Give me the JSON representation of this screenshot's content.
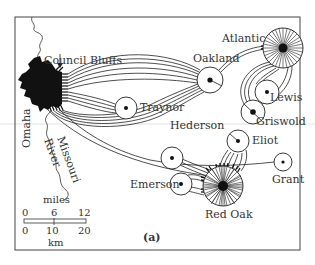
{
  "figure": {
    "panel_label": "(a)"
  },
  "places": {
    "council_bluffs": "Council Bluffs",
    "omaha": "Omaha",
    "river_1": "Missouri",
    "river_2": "River",
    "towns": [
      {
        "name": "Oakland"
      },
      {
        "name": "Atlantic"
      },
      {
        "name": "Lewis"
      },
      {
        "name": "Griswold"
      },
      {
        "name": "Traynor"
      },
      {
        "name": "Hederson"
      },
      {
        "name": "Eliot"
      },
      {
        "name": "Grant"
      },
      {
        "name": "Emerson"
      },
      {
        "name": "Red Oak"
      }
    ]
  },
  "scale_bar": {
    "top_unit": "miles",
    "top_ticks": [
      "0",
      "6",
      "12"
    ],
    "bottom_ticks": [
      "0",
      "10",
      "20"
    ],
    "bottom_unit": "km"
  },
  "colors": {
    "ink": "#222222",
    "paper": "#ffffff",
    "scan_line": "#d8d8d8"
  }
}
